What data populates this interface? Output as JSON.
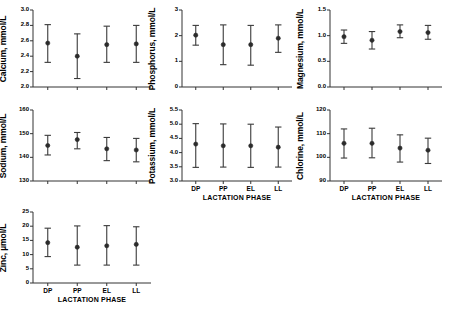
{
  "figure": {
    "xlabel": "LACTATION PHASE",
    "xtick_labels": [
      "DP",
      "PP",
      "EL",
      "LL"
    ]
  },
  "chart_data": [
    {
      "type": "scatter",
      "name": "calcium",
      "title": "",
      "ylabel": "Calcium, mmol/L",
      "xlabel": "",
      "categories": [
        "DP",
        "PP",
        "EL",
        "LL"
      ],
      "values": [
        2.57,
        2.4,
        2.55,
        2.56
      ],
      "err_low": [
        2.32,
        2.11,
        2.32,
        2.32
      ],
      "err_high": [
        2.81,
        2.69,
        2.79,
        2.8
      ],
      "ylim": [
        2.0,
        3.0
      ],
      "yticks": [
        2.0,
        2.2,
        2.4,
        2.6,
        2.8,
        3.0
      ],
      "ytick_labels": [
        "2.0",
        "2.2",
        "2.4",
        "2.6",
        "2.8",
        "3.0"
      ],
      "grid": false,
      "show_xticklabels": false
    },
    {
      "type": "scatter",
      "name": "phosphorus",
      "title": "",
      "ylabel": "Phosphorus, mmol/L",
      "xlabel": "",
      "categories": [
        "DP",
        "PP",
        "EL",
        "LL"
      ],
      "values": [
        2.02,
        1.65,
        1.65,
        1.9
      ],
      "err_low": [
        1.63,
        0.87,
        0.85,
        1.35
      ],
      "err_high": [
        2.4,
        2.42,
        2.4,
        2.42
      ],
      "ylim": [
        0,
        3
      ],
      "yticks": [
        0,
        1,
        2,
        3
      ],
      "ytick_labels": [
        "0",
        "1",
        "2",
        "3"
      ],
      "grid": false,
      "show_xticklabels": false
    },
    {
      "type": "scatter",
      "name": "magnesium",
      "title": "",
      "ylabel": "Magnesium, mmol/L",
      "xlabel": "",
      "categories": [
        "DP",
        "PP",
        "EL",
        "LL"
      ],
      "values": [
        0.98,
        0.91,
        1.08,
        1.06
      ],
      "err_low": [
        0.85,
        0.74,
        0.96,
        0.93
      ],
      "err_high": [
        1.11,
        1.08,
        1.21,
        1.2
      ],
      "ylim": [
        0.0,
        1.5
      ],
      "yticks": [
        0.0,
        0.5,
        1.0,
        1.5
      ],
      "ytick_labels": [
        "0.0",
        "0.5",
        "1.0",
        "1.5"
      ],
      "grid": false,
      "show_xticklabels": false
    },
    {
      "type": "scatter",
      "name": "sodium",
      "title": "",
      "ylabel": "Sodium, mmol/L",
      "xlabel": "",
      "categories": [
        "DP",
        "PP",
        "EL",
        "LL"
      ],
      "values": [
        145.0,
        147.5,
        143.6,
        143.1
      ],
      "err_low": [
        141.0,
        143.6,
        138.6,
        138.1
      ],
      "err_high": [
        149.3,
        150.5,
        148.4,
        148.0
      ],
      "ylim": [
        130,
        160
      ],
      "yticks": [
        130,
        140,
        150,
        160
      ],
      "ytick_labels": [
        "130",
        "140",
        "150",
        "160"
      ],
      "grid": false,
      "show_xticklabels": false
    },
    {
      "type": "scatter",
      "name": "potassium",
      "title": "",
      "ylabel": "Potassium, mmol/L",
      "xlabel": "LACTATION PHASE",
      "categories": [
        "DP",
        "PP",
        "EL",
        "LL"
      ],
      "values": [
        4.3,
        4.24,
        4.24,
        4.19
      ],
      "err_low": [
        3.48,
        3.49,
        3.48,
        3.49
      ],
      "err_high": [
        5.02,
        5.01,
        5.0,
        4.9
      ],
      "ylim": [
        3.0,
        5.5
      ],
      "yticks": [
        3.0,
        3.5,
        4.0,
        4.5,
        5.0,
        5.5
      ],
      "ytick_labels": [
        "3.0",
        "3.5",
        "4.0",
        "4.5",
        "5.0",
        "5.5"
      ],
      "grid": false,
      "show_xticklabels": true
    },
    {
      "type": "scatter",
      "name": "chlorine",
      "title": "",
      "ylabel": "Chlorine, mmol/L",
      "xlabel": "LACTATION PHASE",
      "categories": [
        "DP",
        "PP",
        "EL",
        "LL"
      ],
      "values": [
        105.9,
        105.9,
        103.9,
        103.0
      ],
      "err_low": [
        99.7,
        99.8,
        98.0,
        97.4
      ],
      "err_high": [
        112.0,
        112.3,
        109.5,
        108.1
      ],
      "ylim": [
        90,
        120
      ],
      "yticks": [
        90,
        100,
        110,
        120
      ],
      "ytick_labels": [
        "90",
        "100",
        "110",
        "120"
      ],
      "grid": false,
      "show_xticklabels": true
    },
    {
      "type": "scatter",
      "name": "zinc",
      "title": "",
      "ylabel": "Zinc, µmol/L",
      "xlabel": "LACTATION PHASE",
      "categories": [
        "DP",
        "PP",
        "EL",
        "LL"
      ],
      "values": [
        14.2,
        12.6,
        13.1,
        13.6
      ],
      "err_low": [
        9.3,
        6.3,
        6.3,
        6.3
      ],
      "err_high": [
        19.3,
        20.1,
        20.2,
        19.8
      ],
      "ylim": [
        0,
        25
      ],
      "yticks": [
        0,
        5,
        10,
        15,
        20,
        25
      ],
      "ytick_labels": [
        "0",
        "5",
        "10",
        "15",
        "20",
        "25"
      ],
      "grid": false,
      "show_xticklabels": true
    }
  ]
}
